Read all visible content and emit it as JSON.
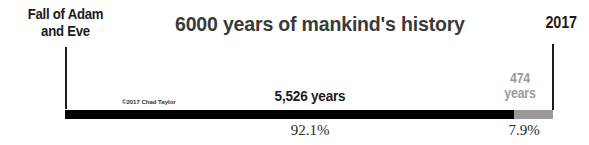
{
  "title": "6000 years of mankind's history",
  "endpoints": {
    "start_line1": "Fall of Adam",
    "start_line2": "and Eve",
    "end_year": "2017"
  },
  "credit": "©2017 Chad Taylor",
  "segments": {
    "major": {
      "label": "5,526 years",
      "percent_label": "92.1%",
      "color": "#000000"
    },
    "minor": {
      "label_line1": "474",
      "label_line2": "years",
      "percent_label": "7.9%",
      "color": "#9a9a9a"
    }
  },
  "chart_data": {
    "type": "bar",
    "title": "6000 years of mankind's history",
    "orientation": "horizontal-stacked",
    "categories": [
      "5,526 years",
      "474 years"
    ],
    "values": [
      5526,
      474
    ],
    "percentages": [
      92.1,
      7.9
    ],
    "colors": [
      "#000000",
      "#9a9a9a"
    ],
    "axis_start_label": "Fall of Adam and Eve",
    "axis_end_label": "2017",
    "total": 6000,
    "xlabel": "",
    "ylabel": "",
    "grid": false,
    "legend": "none",
    "annotations": [
      "©2017 Chad Taylor"
    ]
  }
}
